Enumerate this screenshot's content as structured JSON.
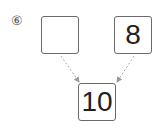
{
  "problem": {
    "label": "⑥",
    "top_left": "",
    "top_right": "8",
    "bottom": "10"
  },
  "colors": {
    "box_border": "#6a6a6a",
    "arrow": "#a0a0a0"
  }
}
